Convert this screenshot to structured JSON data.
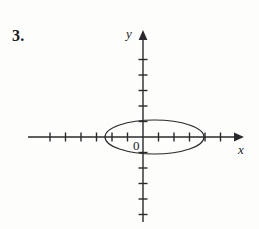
{
  "figure": {
    "problem_number": "3.",
    "origin_label": "0",
    "x_axis_label": "x",
    "y_axis_label": "y",
    "ink_color": "#2a2a2e",
    "background_color": "#fdfdfc"
  },
  "chart_data": {
    "type": "scatter",
    "title": "",
    "subtitle": "",
    "xlabel": "x",
    "ylabel": "y",
    "grid": false,
    "legend": null,
    "annotations": [
      "0"
    ],
    "axis": {
      "origin_px": [
        143,
        137
      ],
      "unit_px": 15.5,
      "x_axis_span_px": [
        28,
        244
      ],
      "y_axis_span_px": [
        30,
        222
      ],
      "xlim": [
        -7.4,
        6.5
      ],
      "ylim": [
        -5.5,
        6.9
      ],
      "x_ticks": [
        -6,
        -5,
        -4,
        -3,
        -2,
        -1,
        1,
        2,
        3,
        4,
        5
      ],
      "y_ticks": [
        -5,
        -4,
        -3,
        -2,
        -1,
        1,
        2,
        3,
        4,
        5
      ],
      "tick_length_px": 9,
      "arrow_x": "right",
      "arrow_y": "up"
    },
    "shapes": [
      {
        "kind": "ellipse",
        "center": [
          0.74,
          0.0
        ],
        "center_px": [
          154.5,
          137
        ],
        "semi_axis_x": 3.19,
        "semi_axis_y": 1.1,
        "semi_axis_x_px": 49.5,
        "semi_axis_y_px": 17,
        "stroke": "#2a2a2e",
        "stroke_width_px": 1.2,
        "fill": "none"
      }
    ]
  }
}
